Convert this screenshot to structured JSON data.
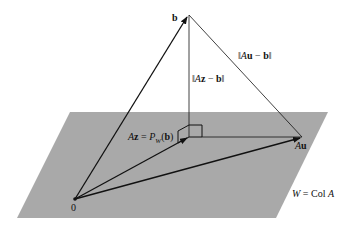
{
  "diagram": {
    "type": "orthogonal-projection",
    "colors": {
      "plane_fill": "#a9a9a9",
      "line": "#111111",
      "background": "#ffffff"
    },
    "plane": {
      "name": "W",
      "label_lhs": "W",
      "label_eq": " = ",
      "label_rhs_text": "Col ",
      "label_rhs_var": "A",
      "corners": [
        [
          70,
          112
        ],
        [
          328,
          112
        ],
        [
          276,
          218
        ],
        [
          17,
          218
        ]
      ]
    },
    "points": {
      "origin": {
        "label": "0",
        "xy": [
          75,
          199
        ]
      },
      "b": {
        "label": "b",
        "xy": [
          189,
          15
        ]
      },
      "Az": {
        "xy": [
          189,
          137
        ]
      },
      "Au": {
        "label_var": "A",
        "label_bold": "u",
        "xy": [
          302,
          137
        ]
      }
    },
    "labels": {
      "proj": {
        "lhs_var": "A",
        "lhs_bold": "z",
        "eq": " = ",
        "p": "P",
        "sub": "W",
        "arg_open": "(",
        "arg_bold": "b",
        "arg_close": ")"
      },
      "dist_az": {
        "open": "‖",
        "var": "A",
        "bold": "z",
        "minus": " − ",
        "b": "b",
        "close": "‖"
      },
      "dist_au": {
        "open": "‖",
        "var": "A",
        "bold": "u",
        "minus": " − ",
        "b": "b",
        "close": "‖"
      }
    }
  }
}
